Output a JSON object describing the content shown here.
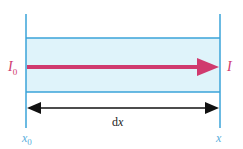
{
  "diagram": {
    "colors": {
      "boundary_line": "#3aa3d8",
      "band_fill": "#dff3fa",
      "beam_arrow": "#d03a6e",
      "dimension_arrow": "#111111",
      "label_intensity": "#d03a6e",
      "label_position": "#5aaedc"
    },
    "labels": {
      "intensity_in": "I",
      "intensity_in_sub": "0",
      "intensity_out": "I",
      "width": "dx",
      "width_d": "d",
      "width_x": "x",
      "position_start": "x",
      "position_start_sub": "0",
      "position_end": "x"
    }
  }
}
